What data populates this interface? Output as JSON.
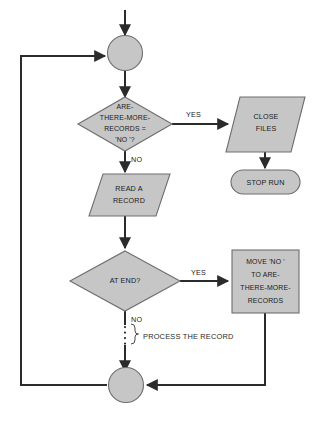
{
  "diagram": {
    "background_color": "#ffffff",
    "shape_fill": "#c6c6c6",
    "shape_stroke": "#6e6e6e",
    "line_color": "#2b2b2b"
  },
  "nodes": {
    "entry_connector": {
      "type": "connector-circle",
      "label": ""
    },
    "decision_more_records": {
      "type": "decision-diamond",
      "lines": [
        "ARE-",
        "THERE-MORE-",
        "RECORDS =",
        "'NO '?"
      ]
    },
    "close_files": {
      "type": "io-parallelogram",
      "lines": [
        "CLOSE",
        "FILES"
      ]
    },
    "stop_run": {
      "type": "terminator",
      "lines": [
        "STOP RUN"
      ]
    },
    "read_a_record": {
      "type": "io-parallelogram",
      "lines": [
        "READ A",
        "RECORD"
      ]
    },
    "decision_at_end": {
      "type": "decision-diamond",
      "lines": [
        "AT END?"
      ]
    },
    "move_no": {
      "type": "process-rectangle",
      "lines": [
        "MOVE 'NO '",
        "TO ARE-",
        "THERE-MORE-",
        "RECORDS"
      ]
    },
    "exit_connector": {
      "type": "connector-circle",
      "label": ""
    }
  },
  "edge_labels": {
    "more_records_yes": "YES",
    "more_records_no": "NO",
    "at_end_yes": "YES",
    "at_end_no": "NO"
  },
  "annotations": {
    "process_the_record": "PROCESS THE RECORD"
  }
}
